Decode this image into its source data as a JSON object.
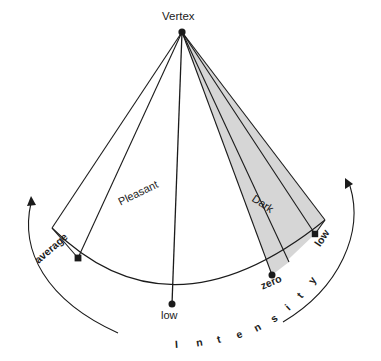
{
  "figure": {
    "title_label": "Vertex",
    "axis_label": "Intensity",
    "axis_letters": [
      "I",
      "n",
      "t",
      "e",
      "n",
      "s",
      "i",
      "t",
      "y"
    ],
    "regions": [
      {
        "name": "Pleasant",
        "label": "Pleasant",
        "fill": "#ffffff"
      },
      {
        "name": "Dark",
        "label": "Dark",
        "fill": "#d6d6d6"
      }
    ],
    "vertex": {
      "label": "Vertex",
      "x": 182,
      "y": 32
    },
    "arc_points": [
      {
        "id": "average",
        "label": "average",
        "x": 78,
        "y": 258
      },
      {
        "id": "low-left",
        "label": "low",
        "x": 172,
        "y": 304
      },
      {
        "id": "zero",
        "label": "zero",
        "x": 272,
        "y": 275
      },
      {
        "id": "low-right",
        "label": "low",
        "x": 315,
        "y": 234
      }
    ],
    "colors": {
      "stroke": "#1b1b1b",
      "dark_region_fill": "#d6d6d6",
      "pleasant_region_fill": "#ffffff",
      "background": "#ffffff",
      "text": "#1b1b1b"
    },
    "arrows": {
      "left_direction": "counterclockwise-up",
      "right_direction": "clockwise-up"
    }
  }
}
